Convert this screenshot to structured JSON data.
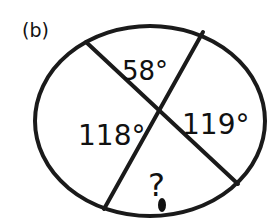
{
  "figure": {
    "label": "(b)",
    "shape": "circle",
    "angles": [
      {
        "position": "top",
        "text": "58°"
      },
      {
        "position": "right",
        "text": "119°"
      },
      {
        "position": "left",
        "text": "118°"
      },
      {
        "position": "bottom",
        "text": "?"
      }
    ]
  },
  "colors": {
    "stroke": "#1a1a1a",
    "background": "#ffffff"
  }
}
